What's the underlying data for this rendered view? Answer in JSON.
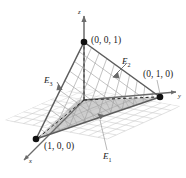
{
  "figure": {
    "type": "3d-diagram",
    "axes": {
      "x_label": "x",
      "y_label": "y",
      "z_label": "z"
    },
    "vertices": [
      {
        "name": "vertex-z",
        "label": "(0, 0, 1)",
        "coords": [
          0,
          0,
          1
        ]
      },
      {
        "name": "vertex-y",
        "label": "(0, 1, 0)",
        "coords": [
          0,
          1,
          0
        ]
      },
      {
        "name": "vertex-x",
        "label": "(1, 0, 0)",
        "coords": [
          1,
          0,
          0
        ]
      }
    ],
    "edges": [
      {
        "name": "edge-e1",
        "label": "E",
        "sub": "1"
      },
      {
        "name": "edge-e2",
        "label": "E",
        "sub": "2"
      },
      {
        "name": "edge-e3",
        "label": "E",
        "sub": "3"
      }
    ],
    "colors": {
      "axis": "#808080",
      "edge": "#6b6b6b",
      "grid_floor": "#c9c9c9",
      "grid_plane": "#9a9a9a",
      "shade_floor": "#9e9e9e",
      "vertex_dot": "#1a1a1a",
      "text": "#1a1a1a"
    }
  }
}
